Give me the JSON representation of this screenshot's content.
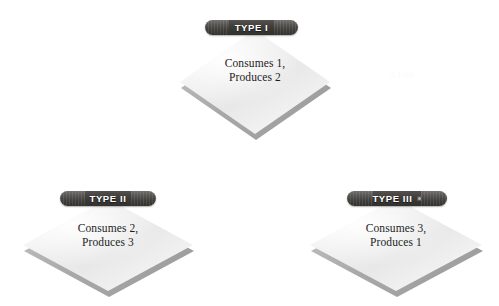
{
  "diagram": {
    "background_color": "#ffffff",
    "banner_color": "#3a3835",
    "banner_text_color": "#ffffff",
    "diamond_face_color": "#efefef",
    "diamond_base_color": "#a8a8a8",
    "body_text_color": "#1d1d1d"
  },
  "nodes": [
    {
      "id": "type-1",
      "banner_label": "TYPE I",
      "body_text": "Consumes 1,\nProduces 2",
      "consumes": 1,
      "produces": 2,
      "has_speck": false
    },
    {
      "id": "type-2",
      "banner_label": "TYPE II",
      "body_text": "Consumes 2,\nProduces 3",
      "consumes": 2,
      "produces": 3,
      "has_speck": false
    },
    {
      "id": "type-3",
      "banner_label": "TYPE III",
      "body_text": "Consumes 3,\nProduces 1",
      "consumes": 3,
      "produces": 1,
      "has_speck": true
    }
  ],
  "artifacts": {
    "faint_top_right": "A100"
  }
}
